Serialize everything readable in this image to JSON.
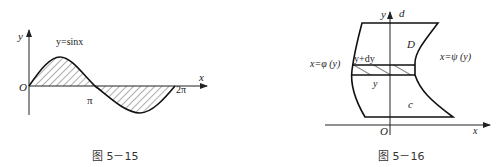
{
  "figures": [
    {
      "id": "fig-5-15",
      "caption": "图 5－15",
      "axis_labels": {
        "x": "x",
        "y": "y",
        "origin": "O"
      },
      "curve_label": "y=sinx",
      "ticks": {
        "pi": "π",
        "two_pi": "2π"
      }
    },
    {
      "id": "fig-5-16",
      "caption": "图 5－16",
      "axis_labels": {
        "x": "x",
        "y": "y",
        "origin": "O"
      },
      "left_curve_label": "x=φ (y)",
      "right_curve_label": "x=ψ (y)",
      "region_label": "D",
      "top_label": "d",
      "bottom_label": "c",
      "strip_top_label": "y+dy",
      "strip_bottom_label": "y"
    }
  ]
}
